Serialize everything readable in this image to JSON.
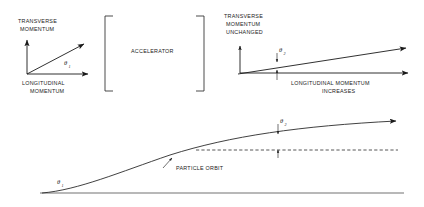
{
  "figure": {
    "background_color": "#ffffff",
    "ink_color": "#1a1a1a"
  },
  "top_left_panel": {
    "name": "before-acceleration-vector-diagram",
    "transverse_axis_label_line1": "TRANSVERSE",
    "transverse_axis_label_line2": "MOMENTUM",
    "longitudinal_axis_label_line1": "LONGITUDINAL",
    "longitudinal_axis_label_line2": "MOMENTUM",
    "angle_symbol": "θ",
    "angle_subscript": "1"
  },
  "accelerator_box": {
    "name": "accelerator-bracket-box",
    "label": "ACCELERATOR"
  },
  "top_right_panel": {
    "name": "after-acceleration-vector-diagram",
    "transverse_label_line1": "TRANSVERSE",
    "transverse_label_line2": "MOMENTUM",
    "transverse_label_line3": "UNCHANGED",
    "longitudinal_label_line1": "LONGITUDINAL MOMENTUM",
    "longitudinal_label_line2": "INCREASES",
    "angle_symbol": "θ",
    "angle_subscript": "2"
  },
  "bottom_panel": {
    "name": "particle-orbit-diagram",
    "orbit_label": "PARTICLE ORBIT",
    "angle_start_symbol": "θ",
    "angle_start_subscript": "1",
    "angle_end_symbol": "θ",
    "angle_end_subscript": "2"
  }
}
